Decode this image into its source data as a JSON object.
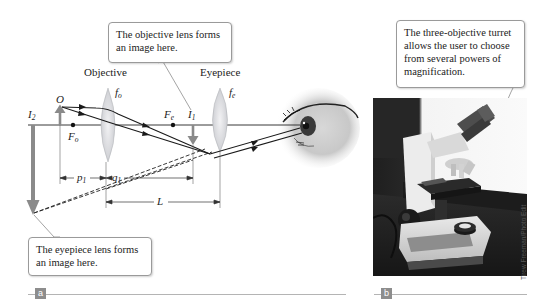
{
  "panels": {
    "a": {
      "tag": "a",
      "lens_labels": {
        "objective": "Objective",
        "eyepiece": "Eyepiece"
      },
      "focal_labels": {
        "fo": {
          "base": "f",
          "sub": "o"
        },
        "fe": {
          "base": "f",
          "sub": "e"
        },
        "Fo": {
          "base": "F",
          "sub": "o"
        },
        "Fe": {
          "base": "F",
          "sub": "e"
        }
      },
      "object_label": "O",
      "image_labels": {
        "I1": {
          "base": "I",
          "sub": "1"
        },
        "I2": {
          "base": "I",
          "sub": "2"
        }
      },
      "dimension_labels": {
        "p1": {
          "base": "p",
          "sub": "1"
        },
        "q1": {
          "base": "q",
          "sub": "1"
        },
        "L": "L"
      },
      "callouts": {
        "objective_image": "The objective lens forms an image here.",
        "eyepiece_image": "The eyepiece lens forms an image here."
      }
    },
    "b": {
      "tag": "b",
      "callout": "The three-objective turret allows the user to choose from several powers of magnification.",
      "photo_credit": "Tirew Freeman/Photo Edit",
      "photo_subject": "compound-microscope-photo"
    }
  },
  "colors": {
    "axis": "#222222",
    "ray": "#1a1a1a",
    "arrow_gray": "#8a8a8a",
    "lens_fill": "#d9dadd",
    "callout_border": "#9a9a9a",
    "panel_tag_bg": "#8d8d8d",
    "rule": "#b4b4b4"
  }
}
